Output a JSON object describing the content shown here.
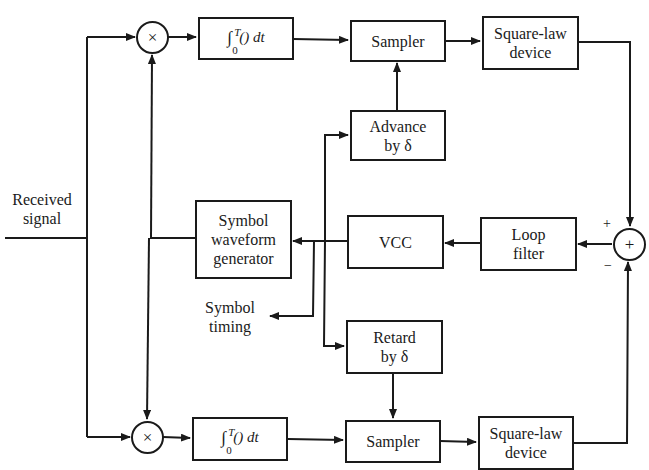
{
  "diagram": {
    "type": "block-diagram",
    "inputs": {
      "received_signal": "Received\nsignal"
    },
    "outputs": {
      "symbol_timing": "Symbol\ntiming"
    },
    "multipliers": {
      "top_symbol": "×",
      "bottom_symbol": "×"
    },
    "integrator": {
      "upper_limit": "T",
      "lower_limit": "0",
      "body": "() dt",
      "integral_sign": "∫"
    },
    "blocks": {
      "top_sampler": "Sampler",
      "top_square_law": "Square-law\ndevice",
      "advance": "Advance\nby δ",
      "symbol_waveform_generator": "Symbol\nwaveform\ngenerator",
      "vcc": "VCC",
      "loop_filter": "Loop\nfilter",
      "retard": "Retard\nby δ",
      "bottom_sampler": "Sampler",
      "bottom_square_law": "Square-law\ndevice"
    },
    "summer": {
      "symbol": "+",
      "plus_sign": "+",
      "minus_sign": "−"
    },
    "colors": {
      "line": "#1a1a1a",
      "background": "#ffffff"
    }
  }
}
